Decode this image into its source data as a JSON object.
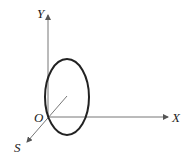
{
  "diagram": {
    "title": "",
    "axes": {
      "y_label": "Y",
      "x_label": "X",
      "s_label": "S",
      "origin_label": "O"
    },
    "shapes": [
      {
        "type": "ellipse",
        "description": "ellipse in Y-S plane near origin"
      }
    ],
    "colors": {
      "line": "#555555",
      "ellipse": "#222222"
    }
  }
}
